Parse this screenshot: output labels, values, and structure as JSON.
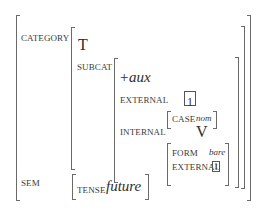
{
  "diagram": {
    "type": "attribute-value-matrix",
    "features": {
      "category": {
        "label": "CATEGORY",
        "head": "T",
        "subcat": {
          "label": "SUBCAT",
          "aux": "+aux",
          "external": {
            "label": "EXTERNAL",
            "tag": "1",
            "case_label": "CASE",
            "case_value": "nom"
          },
          "internal": {
            "label": "INTERNAL",
            "head": "V",
            "form_label": "FORM",
            "form_value": "bare",
            "external_label": "EXTERNAL",
            "external_tag": "1"
          }
        }
      },
      "sem": {
        "label": "SEM",
        "tense_label": "TENSE",
        "tense_value": "future"
      }
    }
  }
}
